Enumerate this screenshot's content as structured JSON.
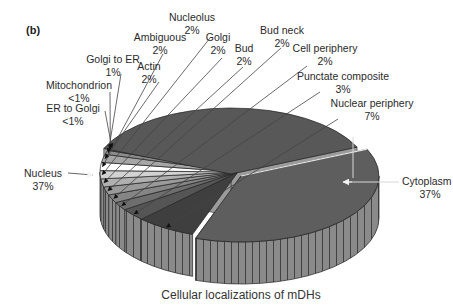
{
  "panel_label": "(b)",
  "chart_data": {
    "type": "pie",
    "style": "3d-exploded",
    "title": "Cellular localizations of mDHs",
    "xlabel": "",
    "ylabel": "",
    "slices": [
      {
        "name": "Cytoplasm",
        "label": "37%",
        "value": 37,
        "color": "#5e5e5e"
      },
      {
        "name": "Nuclear periphery",
        "label": "7%",
        "value": 7,
        "color": "#3f3f3f"
      },
      {
        "name": "Punctate composite",
        "label": "3%",
        "value": 3,
        "color": "#555555"
      },
      {
        "name": "Cell periphery",
        "label": "2%",
        "value": 2,
        "color": "#6e6e6e"
      },
      {
        "name": "Bud neck",
        "label": "2%",
        "value": 2,
        "color": "#858585"
      },
      {
        "name": "Bud",
        "label": "2%",
        "value": 2,
        "color": "#9a9a9a"
      },
      {
        "name": "Golgi",
        "label": "2%",
        "value": 2,
        "color": "#b0b0b0"
      },
      {
        "name": "Nucleolus",
        "label": "2%",
        "value": 2,
        "color": "#d2d2d2"
      },
      {
        "name": "Ambiguous",
        "label": "2%",
        "value": 2,
        "color": "#ffffff"
      },
      {
        "name": "Actin",
        "label": "2%",
        "value": 2,
        "color": "#a6a6a6"
      },
      {
        "name": "Golgi to ER",
        "label": "1%",
        "value": 1,
        "color": "#8c8c8c"
      },
      {
        "name": "Mitochondrion",
        "label": "<1%",
        "value": 0.5,
        "color": "#6a6a6a"
      },
      {
        "name": "ER to Golgi",
        "label": "<1%",
        "value": 0.5,
        "color": "#4d4d4d"
      },
      {
        "name": "Nucleus",
        "label": "37%",
        "value": 37,
        "color": "#585858"
      }
    ],
    "legend": "none (callout labels)"
  }
}
